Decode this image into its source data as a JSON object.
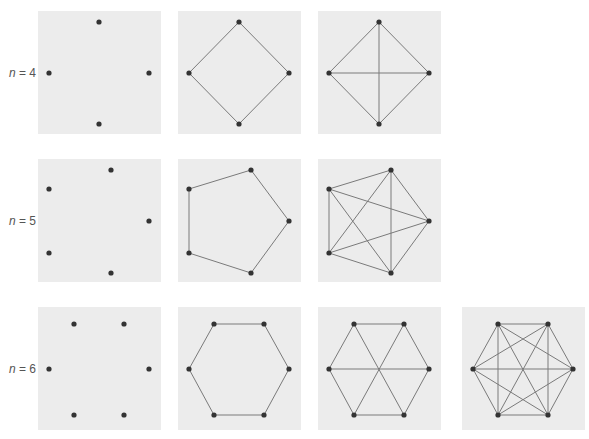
{
  "figure": {
    "colors": {
      "panel_bg": "#ececec",
      "edge": "#7a7a7a",
      "node": "#333333",
      "label": "#555555"
    },
    "rows": [
      {
        "n": 4,
        "label_var": "n",
        "label_rest": " = 4",
        "nodes": [
          [
            61,
            11
          ],
          [
            111,
            62
          ],
          [
            61,
            113
          ],
          [
            11,
            62
          ]
        ],
        "panels": [
          {
            "name": "n4-vertices-only",
            "edges": []
          },
          {
            "name": "n4-cycle",
            "edges": [
              [
                0,
                1
              ],
              [
                1,
                2
              ],
              [
                2,
                3
              ],
              [
                3,
                0
              ]
            ]
          },
          {
            "name": "n4-complete",
            "edges": [
              [
                0,
                1
              ],
              [
                1,
                2
              ],
              [
                2,
                3
              ],
              [
                3,
                0
              ],
              [
                0,
                2
              ],
              [
                1,
                3
              ]
            ]
          }
        ]
      },
      {
        "n": 5,
        "label_var": "n",
        "label_rest": " = 5",
        "nodes": [
          [
            73,
            11
          ],
          [
            111,
            62
          ],
          [
            73,
            114
          ],
          [
            11,
            94
          ],
          [
            11,
            30
          ]
        ],
        "panels": [
          {
            "name": "n5-vertices-only",
            "edges": []
          },
          {
            "name": "n5-cycle",
            "edges": [
              [
                0,
                1
              ],
              [
                1,
                2
              ],
              [
                2,
                3
              ],
              [
                3,
                4
              ],
              [
                4,
                0
              ]
            ]
          },
          {
            "name": "n5-complete",
            "edges": [
              [
                0,
                1
              ],
              [
                1,
                2
              ],
              [
                2,
                3
              ],
              [
                3,
                4
              ],
              [
                4,
                0
              ],
              [
                0,
                2
              ],
              [
                0,
                3
              ],
              [
                1,
                3
              ],
              [
                1,
                4
              ],
              [
                2,
                4
              ]
            ]
          }
        ]
      },
      {
        "n": 6,
        "label_var": "n",
        "label_rest": " = 6",
        "nodes": [
          [
            36,
            17
          ],
          [
            86,
            17
          ],
          [
            111,
            62
          ],
          [
            86,
            108
          ],
          [
            36,
            108
          ],
          [
            11,
            62
          ]
        ],
        "panels": [
          {
            "name": "n6-vertices-only",
            "edges": []
          },
          {
            "name": "n6-cycle",
            "edges": [
              [
                0,
                1
              ],
              [
                1,
                2
              ],
              [
                2,
                3
              ],
              [
                3,
                4
              ],
              [
                4,
                5
              ],
              [
                5,
                0
              ]
            ]
          },
          {
            "name": "n6-cycle-with-diagonals",
            "edges": [
              [
                0,
                1
              ],
              [
                1,
                2
              ],
              [
                2,
                3
              ],
              [
                3,
                4
              ],
              [
                4,
                5
              ],
              [
                5,
                0
              ],
              [
                0,
                3
              ],
              [
                1,
                4
              ],
              [
                2,
                5
              ]
            ]
          },
          {
            "name": "n6-complete",
            "edges": [
              [
                0,
                1
              ],
              [
                1,
                2
              ],
              [
                2,
                3
              ],
              [
                3,
                4
              ],
              [
                4,
                5
              ],
              [
                5,
                0
              ],
              [
                0,
                2
              ],
              [
                0,
                3
              ],
              [
                0,
                4
              ],
              [
                1,
                3
              ],
              [
                1,
                4
              ],
              [
                1,
                5
              ],
              [
                2,
                4
              ],
              [
                2,
                5
              ],
              [
                3,
                5
              ]
            ]
          }
        ]
      }
    ]
  }
}
